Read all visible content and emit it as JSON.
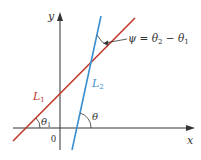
{
  "diagram": {
    "axes": {
      "x_label": "x",
      "y_label": "y",
      "origin_label": "0",
      "axis_color": "#333333"
    },
    "lines": [
      {
        "name": "L1",
        "label": "L",
        "subscript": "1",
        "color": "#c0392b"
      },
      {
        "name": "L2",
        "label": "L",
        "subscript": "2",
        "color": "#3a8fd0"
      }
    ],
    "angles": {
      "theta1": {
        "symbol": "θ",
        "subscript": "1"
      },
      "theta2": {
        "symbol": "θ"
      },
      "psi": {
        "text_prefix": "ψ = θ",
        "sub_a": "2",
        "mid": " − θ",
        "sub_b": "1"
      }
    }
  }
}
